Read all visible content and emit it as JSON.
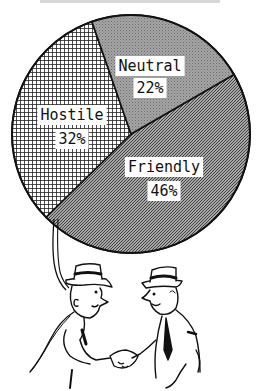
{
  "chart_data": {
    "type": "pie",
    "title": "",
    "slices": [
      {
        "label": "Friendly",
        "value": 46,
        "display": "46%",
        "pattern": "diagonal-hatch"
      },
      {
        "label": "Hostile",
        "value": 32,
        "display": "32%",
        "pattern": "grid-crosshatch"
      },
      {
        "label": "Neutral",
        "value": 22,
        "display": "22%",
        "pattern": "fine-dotted-gray"
      }
    ],
    "legend": "none",
    "start_angle_deg": -30,
    "direction": "clockwise-from-right-boundary",
    "annotations": [
      "Pie chart drawn as a balloon held by a string from a smiling man shaking hands with another man"
    ]
  },
  "illustration": {
    "description": "Two cartoon men in hats shaking hands; left man holds the pie-chart balloon string",
    "colors": {
      "ink": "#111111",
      "paper": "#ffffff",
      "neutral_fill": "#9a9a9a",
      "friendly_fill": "#8c8c8c"
    }
  }
}
